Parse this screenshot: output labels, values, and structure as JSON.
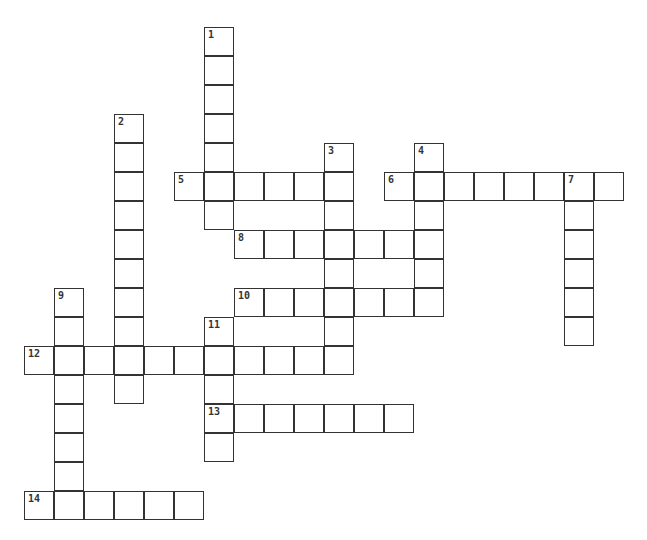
{
  "puzzle": {
    "type": "crossword",
    "origin_x": 25,
    "origin_y": 28,
    "cell_w": 30,
    "cell_h": 29,
    "entries": [
      {
        "number": "1",
        "direction": "down",
        "row": 0,
        "col": 6,
        "length": 7
      },
      {
        "number": "2",
        "direction": "down",
        "row": 3,
        "col": 3,
        "length": 10
      },
      {
        "number": "3",
        "direction": "down",
        "row": 4,
        "col": 10,
        "length": 8
      },
      {
        "number": "4",
        "direction": "down",
        "row": 4,
        "col": 13,
        "length": 6
      },
      {
        "number": "5",
        "direction": "across",
        "row": 5,
        "col": 5,
        "length": 6
      },
      {
        "number": "6",
        "direction": "across",
        "row": 5,
        "col": 12,
        "length": 8
      },
      {
        "number": "7",
        "direction": "down",
        "row": 5,
        "col": 18,
        "length": 6
      },
      {
        "number": "8",
        "direction": "across",
        "row": 7,
        "col": 7,
        "length": 7
      },
      {
        "number": "9",
        "direction": "down",
        "row": 9,
        "col": 1,
        "length": 8
      },
      {
        "number": "10",
        "direction": "across",
        "row": 9,
        "col": 7,
        "length": 7
      },
      {
        "number": "11",
        "direction": "down",
        "row": 10,
        "col": 6,
        "length": 5
      },
      {
        "number": "12",
        "direction": "across",
        "row": 11,
        "col": 0,
        "length": 11
      },
      {
        "number": "13",
        "direction": "across",
        "row": 13,
        "col": 6,
        "length": 7
      },
      {
        "number": "14",
        "direction": "across",
        "row": 16,
        "col": 0,
        "length": 6
      }
    ]
  }
}
